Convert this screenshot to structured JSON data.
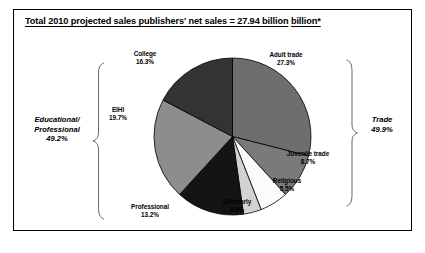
{
  "figure": {
    "title_line1": "Total 2010 projected sales publishers' net sales = 27.94 billion",
    "title_line2": "billion*"
  },
  "chart_data": {
    "type": "pie",
    "title": "Total 2010 projected sales publishers' net sales = 27.94 billion billion*",
    "units": "percent of net sales",
    "start_angle": 0,
    "direction": "clockwise",
    "legend": "none",
    "categories": [
      "Adult trade",
      "Juvenile trade",
      "Religious",
      "Scholarly",
      "Professional",
      "EIHI",
      "College"
    ],
    "values": [
      27.3,
      8.7,
      5.5,
      3.5,
      13.2,
      19.7,
      16.3
    ],
    "colors": [
      "#6e6e6e",
      "#7a7a7a",
      "#fbfbfb",
      "#d2d2d2",
      "#141414",
      "#8d8d8d",
      "#333333"
    ],
    "slices": [
      {
        "name": "Adult trade",
        "label": "Adult trade",
        "pct": "27.3%",
        "value": 27.3,
        "color": "#6e6e6e"
      },
      {
        "name": "Juvenile trade",
        "label": "Juvenile trade",
        "pct": "8.7%",
        "value": 8.7,
        "color": "#7a7a7a"
      },
      {
        "name": "Religious",
        "label": "Religious",
        "pct": "5.5%",
        "value": 5.5,
        "color": "#fbfbfb"
      },
      {
        "name": "Scholarly",
        "label": "Scholarly",
        "pct": "3.5%",
        "value": 3.5,
        "color": "#d2d2d2"
      },
      {
        "name": "Professional",
        "label": "Professional",
        "pct": "13.2%",
        "value": 13.2,
        "color": "#141414"
      },
      {
        "name": "EIHI",
        "label": "EIHI",
        "pct": "19.7%",
        "value": 19.7,
        "color": "#8d8d8d"
      },
      {
        "name": "College",
        "label": "College",
        "pct": "16.3%",
        "value": 16.3,
        "color": "#333333"
      }
    ],
    "groups": [
      {
        "name": "Trade",
        "label": "Trade",
        "pct": "49.9%",
        "value": 49.9,
        "members": [
          "Adult trade",
          "Juvenile trade",
          "Religious",
          "Scholarly"
        ],
        "side": "right"
      },
      {
        "name": "Educational/Professional",
        "label_line1": "Educational/",
        "label_line2": "Professional",
        "pct": "49.2%",
        "value": 49.2,
        "members": [
          "Professional",
          "EIHI",
          "College"
        ],
        "side": "left"
      }
    ]
  }
}
